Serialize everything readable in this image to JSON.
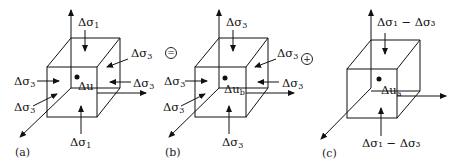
{
  "panels": [
    {
      "id": "a",
      "caption": "(a)",
      "top": "Δσ",
      "top_sub": "1",
      "bottom": "Δσ",
      "bottom_sub": "1",
      "left_upper": "Δσ",
      "left_upper_sub": "3",
      "left_lower": "Δσ",
      "left_lower_sub": "3",
      "right_upper": "Δσ",
      "right_upper_sub": "3",
      "right": "Δσ",
      "right_sub": "3",
      "center": "Δu",
      "center_sub": ""
    },
    {
      "id": "b",
      "caption": "(b)",
      "top": "Δσ",
      "top_sub": "3",
      "bottom": "Δσ",
      "bottom_sub": "3",
      "left_upper": "Δσ",
      "left_upper_sub": "3",
      "left_lower": "Δσ",
      "left_lower_sub": "3",
      "right_upper": "Δσ",
      "right_upper_sub": "3",
      "right": "Δσ",
      "right_sub": "3",
      "center": "Δu",
      "center_sub": "b"
    },
    {
      "id": "c",
      "caption": "(c)",
      "top": "Δσ₁ − Δσ₃",
      "bottom": "Δσ₁ − Δσ₃",
      "center": "Δu",
      "center_sub": "a"
    }
  ],
  "operators": {
    "equals": "=",
    "plus": "+"
  }
}
